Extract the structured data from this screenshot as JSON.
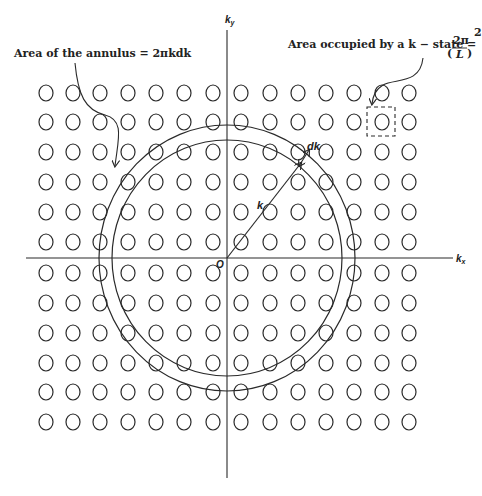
{
  "diagram": {
    "axes": {
      "x_label": "k",
      "x_sub": "x",
      "y_label": "k",
      "y_sub": "y",
      "origin_label": "O"
    },
    "annotations": {
      "annulus_area": "Area of the annulus = 2πkdk",
      "kstate_area_prefix": "Area occupied by a k − state = ",
      "kstate_frac_num": "2π",
      "kstate_frac_den": "L",
      "kstate_exp": "2",
      "k_label": "k",
      "dk_label": "dk"
    },
    "grid": {
      "columns": [
        46,
        73,
        100,
        128,
        156,
        184,
        213,
        241,
        270,
        298,
        326,
        354,
        382,
        409
      ],
      "rows": [
        93,
        122,
        152,
        182,
        212,
        242,
        273,
        303,
        333,
        363,
        392,
        422
      ],
      "state_rx": 7,
      "state_ry": 8
    },
    "rings": {
      "center": [
        227,
        258
      ],
      "inner": {
        "rx": 115,
        "ry": 118
      },
      "outer": {
        "rx": 128,
        "ry": 133
      }
    },
    "colors": {
      "stroke": "#2a2a2a",
      "background": "#ffffff"
    }
  }
}
